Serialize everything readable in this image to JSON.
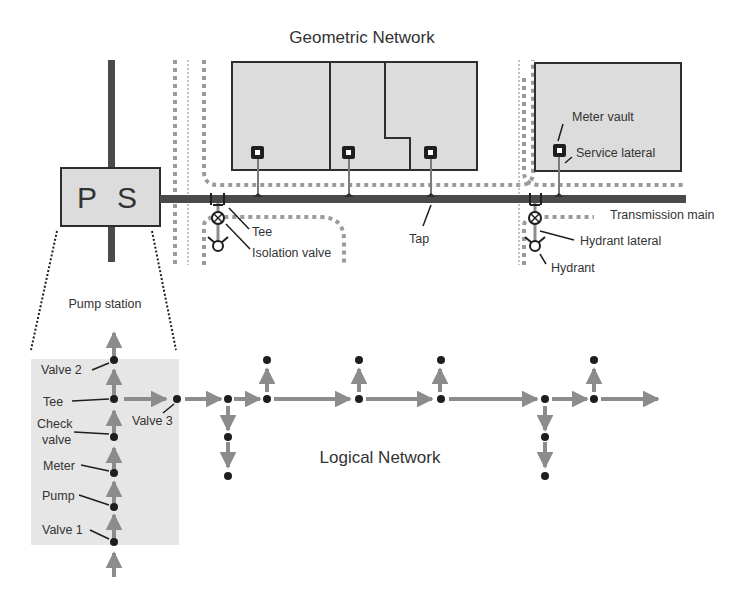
{
  "geometric": {
    "title": "Geometric Network",
    "pump_station_box": "P S",
    "labels": {
      "tee": "Tee",
      "isolation_valve": "Isolation valve",
      "tap": "Tap",
      "meter_vault": "Meter vault",
      "service_lateral": "Service lateral",
      "transmission_main": "Transmission main",
      "hydrant_lateral": "Hydrant lateral",
      "hydrant": "Hydrant"
    }
  },
  "pump_station": {
    "title": "Pump station",
    "labels": {
      "valve2": "Valve 2",
      "tee": "Tee",
      "check": "Check",
      "valve": "valve",
      "meter": "Meter",
      "pump": "Pump",
      "valve1": "Valve 1",
      "valve3": "Valve 3"
    }
  },
  "logical": {
    "title": "Logical Network"
  },
  "colors": {
    "main_pipe": "#4a4a4a",
    "parcel_fill": "#dcdcdc",
    "arrow": "#8c8c8c",
    "node": "#1e1e1e",
    "dotted_road": "#9a9a9a",
    "pump_bg": "#e6e6e6"
  }
}
